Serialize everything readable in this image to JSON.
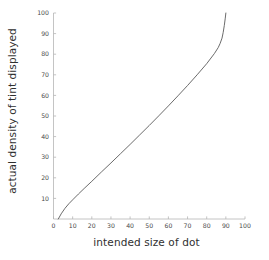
{
  "chart_data": {
    "type": "line",
    "title": "",
    "subtitle": "",
    "xlabel": "intended size of dot",
    "ylabel": "actual density of tint displayed",
    "xlim": [
      0,
      100
    ],
    "ylim": [
      0,
      100
    ],
    "xticks": [
      0,
      10,
      20,
      30,
      40,
      50,
      60,
      70,
      80,
      90,
      100
    ],
    "yticks": [
      10,
      20,
      30,
      40,
      50,
      60,
      70,
      80,
      90,
      100
    ],
    "xtick_labels": [
      "0",
      "10",
      "20",
      "30",
      "40",
      "50",
      "60",
      "70",
      "80",
      "90",
      "100"
    ],
    "ytick_labels": [
      "10",
      "20",
      "30",
      "40",
      "50",
      "60",
      "70",
      "80",
      "90",
      "100"
    ],
    "grid": false,
    "legend": null,
    "legend_position": "none",
    "line_color": "#5a5a5a",
    "axis_color": "#b5b5b5",
    "text_color": "#2f2f2f",
    "background_color": "#ffffff",
    "annotations": [],
    "series": [
      {
        "name": "dot gain curve",
        "x": [
          2.5,
          4,
          6,
          8,
          10,
          13,
          16,
          20,
          25,
          30,
          35,
          40,
          45,
          50,
          55,
          60,
          65,
          70,
          75,
          80,
          84,
          86,
          87,
          88,
          88.6,
          89.2,
          89.7,
          90
        ],
        "y": [
          0,
          2.5,
          5.2,
          7.4,
          9.3,
          12.1,
          14.8,
          18.3,
          22.8,
          27.2,
          31.7,
          36.2,
          40.8,
          45.4,
          50.1,
          54.9,
          59.8,
          64.8,
          70.0,
          75.4,
          80.3,
          83.2,
          85.2,
          87.8,
          90.5,
          94.0,
          97.5,
          100
        ]
      }
    ]
  }
}
